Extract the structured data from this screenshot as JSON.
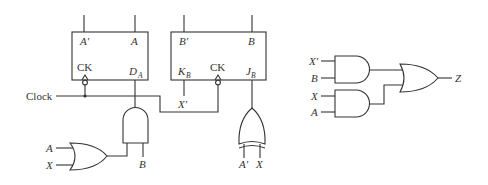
{
  "diagram": {
    "type": "sequential-logic-circuit",
    "flipflop_a": {
      "type": "D flip-flop",
      "outputs": {
        "q_bar": "A′",
        "q": "A"
      },
      "clock_label": "CK",
      "input_label": "D",
      "input_sub": "A"
    },
    "flipflop_b": {
      "type": "JK flip-flop",
      "outputs": {
        "q_bar": "B′",
        "q": "B"
      },
      "clock_label": "CK",
      "k_label": "K",
      "k_sub": "B",
      "j_label": "J",
      "j_sub": "B",
      "k_input": "X′"
    },
    "clock": {
      "label": "Clock"
    },
    "da_logic": {
      "and_gate_inputs": [
        "OR(A, X)",
        "B"
      ],
      "or_gate_inputs": [
        "A",
        "X"
      ],
      "labels": {
        "or_in_1": "A",
        "or_in_2": "X",
        "and_in_b": "B"
      }
    },
    "jb_logic": {
      "gate": "XOR",
      "inputs": [
        "A′",
        "X"
      ]
    },
    "output_logic": {
      "and1_inputs": [
        "X′",
        "B"
      ],
      "and2_inputs": [
        "X",
        "A"
      ],
      "or_gate": "OR",
      "output": "Z"
    }
  }
}
